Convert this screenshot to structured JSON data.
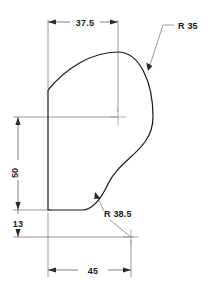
{
  "drawing": {
    "title": "Cam profile technical drawing",
    "units_implied": "mm",
    "background_color": "#ffffff",
    "line_color": "#1a1a1a",
    "dimension_color": "#4a4a4a",
    "dimensions": [
      {
        "id": "width-top",
        "label": "37.5",
        "orientation": "horizontal",
        "position": "top",
        "from": "left-vertical-edge",
        "to": "r35-arc-center"
      },
      {
        "id": "height-left",
        "label": "50",
        "orientation": "vertical",
        "position": "left",
        "from": "r35-arc-center-height",
        "to": "bottom-edge"
      },
      {
        "id": "offset-bottom",
        "label": "13",
        "orientation": "vertical",
        "position": "left",
        "from": "bottom-edge",
        "to": "r38.5-arc-center"
      },
      {
        "id": "width-bottom",
        "label": "45",
        "orientation": "horizontal",
        "position": "bottom",
        "from": "left-vertical-edge",
        "to": "r38.5-arc-center"
      }
    ],
    "radii": [
      {
        "id": "radius-large",
        "label": "R 35",
        "value": 35,
        "kind": "convex",
        "leader_from": "top-right",
        "points_to": "upper-right-arc"
      },
      {
        "id": "radius-fillet",
        "label": "R 38.5",
        "value": 38.5,
        "kind": "concave-fillet",
        "leader_from": "bottom-right",
        "points_to": "lower-fillet-arc"
      }
    ],
    "center_marks": [
      {
        "id": "r35-center",
        "label": ""
      },
      {
        "id": "r38-5-center",
        "label": ""
      }
    ]
  }
}
